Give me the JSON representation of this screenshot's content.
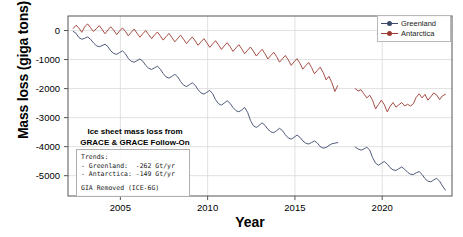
{
  "chart_data": {
    "type": "line",
    "title": "",
    "xlabel": "Year",
    "ylabel": "Mass loss (giga tons)",
    "xlim": [
      2002,
      2024
    ],
    "ylim": [
      -5700,
      500
    ],
    "grid": true,
    "legend_position": "upper right",
    "xticks": [
      2005,
      2010,
      2015,
      2020
    ],
    "xticklabels": [
      "2005",
      "2010",
      "2015",
      "2020"
    ],
    "yticks": [
      0,
      -1000,
      -2000,
      -3000,
      -4000,
      -5000
    ],
    "yticklabels": [
      "0",
      "-1000",
      "-2000",
      "-3000",
      "-4000",
      "-5000"
    ],
    "units": "giga tons",
    "series": [
      {
        "name": "Greenland",
        "color": "#3b4a6b",
        "trend": "-262 Gt/yr",
        "segments": [
          {
            "mission": "GRACE",
            "x": [
              2002.3,
              2002.46,
              2002.62,
              2002.79,
              2002.95,
              2003.12,
              2003.29,
              2003.45,
              2003.62,
              2003.79,
              2003.95,
              2004.12,
              2004.29,
              2004.45,
              2004.62,
              2004.79,
              2004.95,
              2005.12,
              2005.29,
              2005.45,
              2005.62,
              2005.79,
              2005.95,
              2006.12,
              2006.29,
              2006.45,
              2006.62,
              2006.79,
              2006.95,
              2007.12,
              2007.29,
              2007.45,
              2007.62,
              2007.79,
              2007.95,
              2008.12,
              2008.29,
              2008.45,
              2008.62,
              2008.79,
              2008.95,
              2009.12,
              2009.29,
              2009.45,
              2009.62,
              2009.79,
              2009.95,
              2010.12,
              2010.29,
              2010.45,
              2010.62,
              2010.79,
              2010.95,
              2011.12,
              2011.29,
              2011.45,
              2011.62,
              2011.79,
              2011.95,
              2012.12,
              2012.29,
              2012.45,
              2012.62,
              2012.79,
              2012.95,
              2013.12,
              2013.29,
              2013.45,
              2013.62,
              2013.79,
              2013.95,
              2014.12,
              2014.29,
              2014.45,
              2014.62,
              2014.79,
              2014.95,
              2015.12,
              2015.29,
              2015.45,
              2015.62,
              2015.79,
              2015.95,
              2016.12,
              2016.29,
              2016.45,
              2016.62,
              2016.79,
              2016.95,
              2017.12,
              2017.29,
              2017.45
            ],
            "y": [
              -30,
              -95,
              -240,
              -300,
              -270,
              -220,
              -300,
              -420,
              -520,
              -560,
              -520,
              -470,
              -560,
              -700,
              -790,
              -820,
              -760,
              -700,
              -800,
              -960,
              -1060,
              -1090,
              -1040,
              -980,
              -1060,
              -1200,
              -1300,
              -1340,
              -1290,
              -1230,
              -1330,
              -1480,
              -1600,
              -1640,
              -1580,
              -1510,
              -1600,
              -1760,
              -1880,
              -1930,
              -1870,
              -1800,
              -1890,
              -2040,
              -2150,
              -2190,
              -2130,
              -2060,
              -2180,
              -2380,
              -2520,
              -2570,
              -2500,
              -2420,
              -2510,
              -2650,
              -2760,
              -2800,
              -2740,
              -2650,
              -2820,
              -3090,
              -3280,
              -3340,
              -3270,
              -3180,
              -3270,
              -3400,
              -3490,
              -3520,
              -3450,
              -3370,
              -3450,
              -3590,
              -3700,
              -3740,
              -3680,
              -3600,
              -3680,
              -3800,
              -3880,
              -3910,
              -3860,
              -3800,
              -3880,
              -4000,
              -4050,
              -4030,
              -3960,
              -3900,
              -3880,
              -3860
            ]
          },
          {
            "mission": "GRACE Follow-On",
            "x": [
              2018.45,
              2018.62,
              2018.79,
              2018.95,
              2019.12,
              2019.29,
              2019.45,
              2019.62,
              2019.79,
              2019.95,
              2020.12,
              2020.29,
              2020.45,
              2020.62,
              2020.79,
              2020.95,
              2021.12,
              2021.29,
              2021.45,
              2021.62,
              2021.79,
              2021.95,
              2022.12,
              2022.29,
              2022.45,
              2022.62,
              2022.79,
              2022.95,
              2023.12,
              2023.29,
              2023.45,
              2023.62
            ],
            "y": [
              -4010,
              -4080,
              -4120,
              -4080,
              -4020,
              -4120,
              -4380,
              -4570,
              -4640,
              -4580,
              -4510,
              -4600,
              -4720,
              -4800,
              -4820,
              -4760,
              -4700,
              -4780,
              -4880,
              -4950,
              -4960,
              -4900,
              -4860,
              -4960,
              -5100,
              -5190,
              -5210,
              -5150,
              -5090,
              -5190,
              -5350,
              -5500
            ]
          }
        ]
      },
      {
        "name": "Antarctica",
        "color": "#9c3a32",
        "trend": "-149 Gt/yr",
        "segments": [
          {
            "mission": "GRACE",
            "x": [
              2002.3,
              2002.46,
              2002.62,
              2002.79,
              2002.95,
              2003.12,
              2003.29,
              2003.45,
              2003.62,
              2003.79,
              2003.95,
              2004.12,
              2004.29,
              2004.45,
              2004.62,
              2004.79,
              2004.95,
              2005.12,
              2005.29,
              2005.45,
              2005.62,
              2005.79,
              2005.95,
              2006.12,
              2006.29,
              2006.45,
              2006.62,
              2006.79,
              2006.95,
              2007.12,
              2007.29,
              2007.45,
              2007.62,
              2007.79,
              2007.95,
              2008.12,
              2008.29,
              2008.45,
              2008.62,
              2008.79,
              2008.95,
              2009.12,
              2009.29,
              2009.45,
              2009.62,
              2009.79,
              2009.95,
              2010.12,
              2010.29,
              2010.45,
              2010.62,
              2010.79,
              2010.95,
              2011.12,
              2011.29,
              2011.45,
              2011.62,
              2011.79,
              2011.95,
              2012.12,
              2012.29,
              2012.45,
              2012.62,
              2012.79,
              2012.95,
              2013.12,
              2013.29,
              2013.45,
              2013.62,
              2013.79,
              2013.95,
              2014.12,
              2014.29,
              2014.45,
              2014.62,
              2014.79,
              2014.95,
              2015.12,
              2015.29,
              2015.45,
              2015.62,
              2015.79,
              2015.95,
              2016.12,
              2016.29,
              2016.45,
              2016.62,
              2016.79,
              2016.95,
              2017.12,
              2017.29,
              2017.45
            ],
            "y": [
              70,
              180,
              90,
              -60,
              120,
              230,
              100,
              -30,
              60,
              170,
              40,
              -110,
              20,
              130,
              10,
              -140,
              -20,
              90,
              -30,
              -180,
              -60,
              50,
              -90,
              -230,
              -110,
              0,
              -140,
              -280,
              -160,
              -50,
              -190,
              -330,
              -210,
              -100,
              -240,
              -390,
              -270,
              -160,
              -300,
              -450,
              -330,
              -220,
              -360,
              -510,
              -390,
              -280,
              -420,
              -580,
              -460,
              -350,
              -490,
              -650,
              -530,
              -420,
              -560,
              -720,
              -600,
              -490,
              -630,
              -800,
              -680,
              -570,
              -710,
              -880,
              -760,
              -650,
              -800,
              -980,
              -860,
              -750,
              -900,
              -1090,
              -970,
              -860,
              -1010,
              -1200,
              -1080,
              -970,
              -1130,
              -1330,
              -1210,
              -1100,
              -1270,
              -1490,
              -1370,
              -1260,
              -1450,
              -1700,
              -1580,
              -1800,
              -2100,
              -1900
            ]
          },
          {
            "mission": "GRACE Follow-On",
            "x": [
              2018.45,
              2018.62,
              2018.79,
              2018.95,
              2019.12,
              2019.29,
              2019.45,
              2019.62,
              2019.79,
              2019.95,
              2020.12,
              2020.29,
              2020.45,
              2020.62,
              2020.79,
              2020.95,
              2021.12,
              2021.29,
              2021.45,
              2021.62,
              2021.79,
              2021.95,
              2022.12,
              2022.29,
              2022.45,
              2022.62,
              2022.79,
              2022.95,
              2023.12,
              2023.29,
              2023.45,
              2023.62
            ],
            "y": [
              -2000,
              -2080,
              -2040,
              -2180,
              -2320,
              -2230,
              -2400,
              -2700,
              -2550,
              -2400,
              -2550,
              -2800,
              -2620,
              -2480,
              -2640,
              -2560,
              -2480,
              -2600,
              -2540,
              -2600,
              -2520,
              -2300,
              -2180,
              -2320,
              -2200,
              -2400,
              -2280,
              -2150,
              -2220,
              -2380,
              -2250,
              -2200
            ]
          }
        ]
      }
    ],
    "annotation": {
      "title_line1": "Ice sheet mass loss from",
      "title_line2": "GRACE & GRACE Follow-On",
      "box_lines": [
        "Trends:",
        "- Greenland:  -262 Gt/yr",
        "- Antarctica: -149 Gt/yr"
      ],
      "box_footer": "GIA Removed (ICE-6G)"
    }
  },
  "legend": {
    "items": [
      {
        "label": "Greenland",
        "color": "#3b4a6b"
      },
      {
        "label": "Antarctica",
        "color": "#9c3a32"
      }
    ]
  },
  "axes": {
    "xlabel": "Year",
    "ylabel": "Mass loss (giga tons)"
  }
}
